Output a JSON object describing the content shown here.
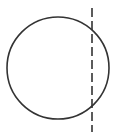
{
  "diagram": {
    "type": "geometry",
    "circle": {
      "cx": 58,
      "cy": 68,
      "r": 51,
      "stroke": "#333333",
      "stroke_width": 1.6
    },
    "dashed_line": {
      "x": 92,
      "y1": 8,
      "y2": 132,
      "stroke": "#333333",
      "stroke_width": 1.6,
      "dasharray": "9 4"
    }
  }
}
